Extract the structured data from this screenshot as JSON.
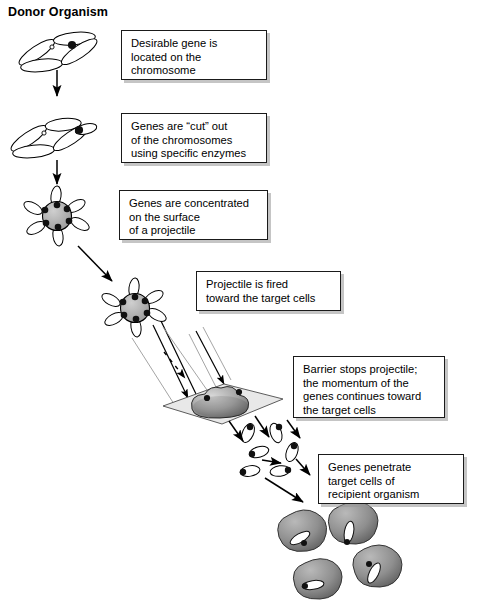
{
  "diagram": {
    "title": "Donor Organism",
    "type": "biolistic-gene-transfer-flowchart",
    "background_color": "#ffffff",
    "ink_color": "#000000",
    "fill_gray": "#9a9a9a",
    "barrier_gray": "#e3e3e3"
  },
  "callouts": [
    {
      "name": "callout-desirable-gene",
      "text": "Desirable gene is\nlocated on the\nchromosome",
      "x": 121,
      "y": 30,
      "w": 146,
      "h": 50
    },
    {
      "name": "callout-genes-cut",
      "text": "Genes are “cut” out\nof the chromosomes\nusing specific enzymes",
      "x": 121,
      "y": 113,
      "w": 146,
      "h": 50
    },
    {
      "name": "callout-genes-concentrated",
      "text": "Genes are concentrated\non the surface\nof a projectile",
      "x": 119,
      "y": 190,
      "w": 149,
      "h": 50
    },
    {
      "name": "callout-projectile-fired",
      "text": "Projectile is fired\ntoward the target cells",
      "x": 196,
      "y": 271,
      "w": 145,
      "h": 40
    },
    {
      "name": "callout-barrier-stops",
      "text": "Barrier stops projectile;\nthe momentum of the\ngenes continues toward\nthe target cells",
      "x": 293,
      "y": 356,
      "w": 152,
      "h": 62
    },
    {
      "name": "callout-genes-penetrate",
      "text": "Genes penetrate\ntarget  cells of\nrecipient organism",
      "x": 318,
      "y": 454,
      "w": 146,
      "h": 50
    }
  ],
  "steps": [
    {
      "name": "chromosome-with-gene",
      "label": "chromosome with desirable gene marked"
    },
    {
      "name": "chromosome-gene-cut",
      "label": "chromosome with gene cut out"
    },
    {
      "name": "projectile-coated",
      "label": "projectile coated with genes"
    },
    {
      "name": "projectile-in-flight",
      "label": "projectile fired toward target"
    },
    {
      "name": "barrier-with-stopped-projectile",
      "label": "barrier plate stopping projectile"
    },
    {
      "name": "genes-in-flight",
      "label": "genes continuing toward target cells"
    },
    {
      "name": "target-cells",
      "label": "four recipient target cells with genes inside"
    }
  ]
}
